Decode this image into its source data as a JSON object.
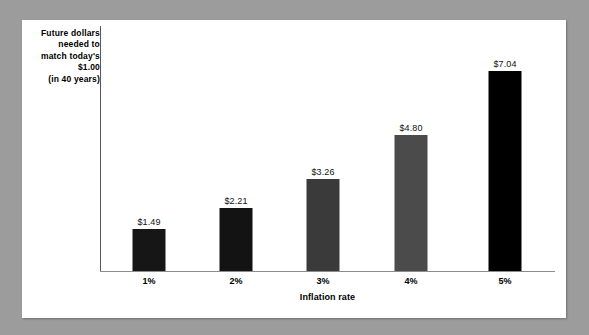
{
  "panel": {
    "background_color": "#ffffff",
    "mat_color": "#9c9c9c"
  },
  "chart_data": {
    "type": "bar",
    "title": "",
    "subtitle": "",
    "xlabel": "Inflation rate",
    "ylabel_lines": [
      "Future dollars",
      "needed to",
      "match today's",
      "$1.00",
      "(in 40 years)"
    ],
    "ylabel": "Future dollars needed to match today's $1.00 (in 40 years)",
    "categories": [
      "1%",
      "2%",
      "3%",
      "4%",
      "5%"
    ],
    "values": [
      1.49,
      2.21,
      3.26,
      4.8,
      7.04
    ],
    "value_labels": [
      "$1.49",
      "$2.21",
      "$3.26",
      "$4.80",
      "$7.04"
    ],
    "bar_colors": [
      "#161616",
      "#131313",
      "#3a3a3a",
      "#4b4b4b",
      "#000000"
    ],
    "ylim": [
      0,
      8.5
    ],
    "grid": false,
    "legend": false,
    "axis_line_color": "#55585c"
  }
}
